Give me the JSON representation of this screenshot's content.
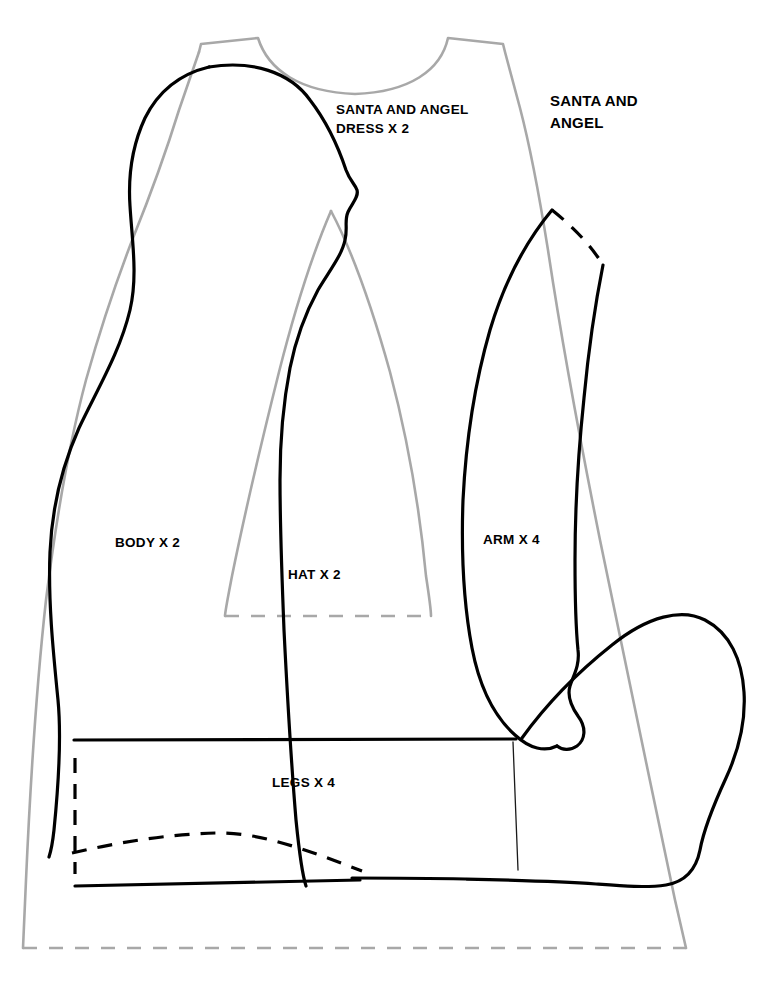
{
  "document": {
    "kind": "sewing-pattern-sheet",
    "background_color": "#ffffff"
  },
  "colors": {
    "piece_black": "#000000",
    "piece_gray": "#a8a8a8",
    "thin_line": "#1a1a1a",
    "text": "#000000"
  },
  "labels": {
    "dress_title_line1": "SANTA AND ANGEL",
    "dress_title_line2": "DRESS X 2",
    "set_title_line1": "SANTA AND",
    "set_title_line2": "ANGEL",
    "body": "BODY X 2",
    "hat": "HAT X 2",
    "arm": "ARM X 4",
    "legs": "LEGS X 4"
  },
  "pieces": [
    {
      "name": "santa-and-angel-dress",
      "label": "SANTA AND ANGEL DRESS X 2",
      "quantity": 2,
      "stroke_color": "#a8a8a8",
      "line_style": "solid-with-dashed-hem"
    },
    {
      "name": "body",
      "label": "BODY X 2",
      "quantity": 2,
      "stroke_color": "#000000",
      "line_style": "solid"
    },
    {
      "name": "hat",
      "label": "HAT X 2",
      "quantity": 2,
      "stroke_color": "#a8a8a8",
      "line_style": "solid-with-dashed-base"
    },
    {
      "name": "arm",
      "label": "ARM X 4",
      "quantity": 4,
      "stroke_color": "#000000",
      "line_style": "solid-with-dashed-shoulder"
    },
    {
      "name": "legs",
      "label": "LEGS X 4",
      "quantity": 4,
      "stroke_color": "#000000",
      "line_style": "solid-with-dashed-fold"
    }
  ]
}
